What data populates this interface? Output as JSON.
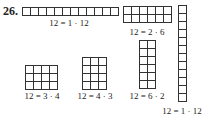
{
  "problem_number": "26.",
  "rectangles": [
    {
      "rows": 1,
      "cols": 12,
      "label": "12 = 1 · 12",
      "x": 22,
      "y": 7,
      "cell": 8,
      "label_x": 69,
      "label_y": 18
    },
    {
      "rows": 2,
      "cols": 6,
      "label": "12 = 2 · 6",
      "x": 123,
      "y": 6,
      "cell": 8,
      "label_x": 147,
      "label_y": 27
    },
    {
      "rows": 12,
      "cols": 1,
      "label": "12 = 1 · 12",
      "x": 178,
      "y": 5,
      "cell": 8,
      "label_x": 182,
      "label_y": 106
    },
    {
      "rows": 6,
      "cols": 2,
      "label": "12 = 6 · 2",
      "x": 139,
      "y": 40,
      "cell": 8,
      "label_x": 147,
      "label_y": 91
    },
    {
      "rows": 3,
      "cols": 4,
      "label": "12 = 3 · 4",
      "x": 25,
      "y": 65,
      "cell": 8,
      "label_x": 42,
      "label_y": 91
    },
    {
      "rows": 4,
      "cols": 3,
      "label": "12 = 4 · 3",
      "x": 82,
      "y": 57,
      "cell": 8,
      "label_x": 95,
      "label_y": 91
    }
  ]
}
